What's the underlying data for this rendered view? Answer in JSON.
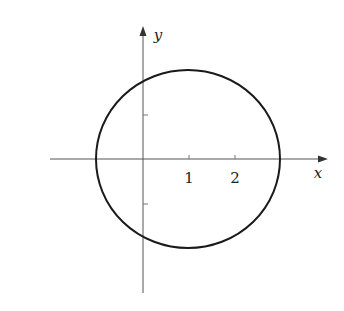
{
  "figure": {
    "type": "circle-on-axes",
    "axes": {
      "x_label": "x",
      "y_label": "y",
      "x_tick_labels": [
        "1",
        "2"
      ]
    },
    "curve": {
      "description": "closed circle-like curve crossing x-axis left of origin and right of x=2",
      "stroke": "#1a1a1a"
    },
    "colors": {
      "axis": "#555555",
      "curve": "#1a1a1a",
      "background": "#ffffff"
    }
  }
}
